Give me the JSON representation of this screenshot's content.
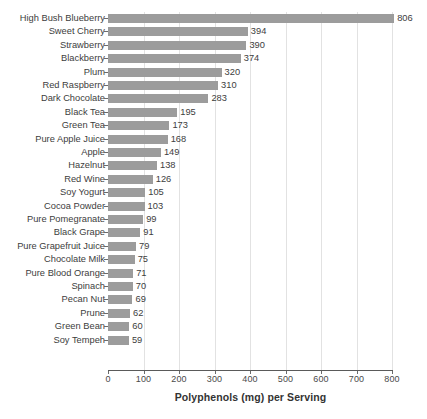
{
  "chart_data": {
    "type": "bar",
    "orientation": "horizontal",
    "title": "",
    "subtitle": "",
    "xlabel": "Polyphenols (mg) per Serving",
    "ylabel": "",
    "xlim": [
      0,
      800
    ],
    "xticks": [
      0,
      100,
      200,
      300,
      400,
      500,
      600,
      700,
      800
    ],
    "xtick_labels": [
      "0",
      "100",
      "200",
      "300",
      "400",
      "500",
      "600",
      "700",
      "800"
    ],
    "grid": "vertical",
    "legend": "none",
    "bar_color": "#9c9c9c",
    "value_labels": true,
    "categories": [
      "High Bush Blueberry",
      "Sweet Cherry",
      "Strawberry",
      "Blackberry",
      "Plum",
      "Red Raspberry",
      "Dark Chocolate",
      "Black Tea",
      "Green Tea",
      "Pure Apple Juice",
      "Apple",
      "Hazelnut",
      "Red Wine",
      "Soy Yogurt",
      "Cocoa Powder",
      "Pure Pomegranate",
      "Black Grape",
      "Pure Grapefruit Juice",
      "Chocolate Milk",
      "Pure Blood Orange",
      "Spinach",
      "Pecan Nut",
      "Prune",
      "Green Bean",
      "Soy Tempeh"
    ],
    "values": [
      806,
      394,
      390,
      374,
      320,
      310,
      283,
      195,
      173,
      168,
      149,
      138,
      126,
      105,
      103,
      99,
      91,
      79,
      75,
      71,
      70,
      69,
      62,
      60,
      59
    ],
    "value_label_texts": [
      "806",
      "394",
      "390",
      "374",
      "320",
      "310",
      "283",
      "195",
      "173",
      "168",
      "149",
      "138",
      "126",
      "105",
      "103",
      "99",
      "91",
      "79",
      "75",
      "71",
      "70",
      "69",
      "62",
      "60",
      "59"
    ]
  }
}
